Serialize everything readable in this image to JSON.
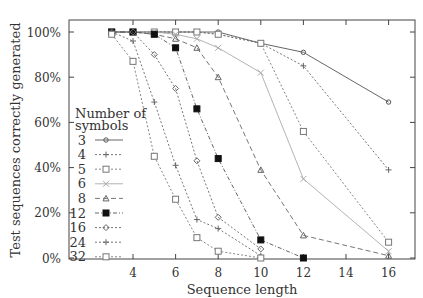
{
  "chart_data": {
    "type": "line",
    "title": "",
    "xlabel": "Sequence length",
    "ylabel": "Test sequences correctly generated",
    "xlim": [
      1,
      17
    ],
    "ylim": [
      0,
      110
    ],
    "xticks": [
      4,
      6,
      8,
      10,
      12,
      14,
      16
    ],
    "yticks": [
      0,
      20,
      40,
      60,
      80,
      100
    ],
    "ytick_labels": [
      "0%",
      "20%",
      "40%",
      "60%",
      "80%",
      "100%"
    ],
    "grid": false,
    "legend_title": [
      "Number of",
      "symbols"
    ],
    "legend_position": "inside-left",
    "series": [
      {
        "name": "3",
        "marker": "circle-dot",
        "dash": "",
        "color": "#555555",
        "x": [
          3,
          4,
          5,
          6,
          7,
          8,
          10,
          12,
          16
        ],
        "values": [
          100,
          100,
          100,
          100,
          100,
          100,
          95,
          91,
          69
        ]
      },
      {
        "name": "4",
        "marker": "plus",
        "dash": "2,2",
        "color": "#666666",
        "x": [
          3,
          4,
          5,
          6,
          7,
          8,
          10,
          12,
          16
        ],
        "values": [
          100,
          100,
          100,
          100,
          100,
          99,
          95,
          85,
          39
        ]
      },
      {
        "name": "5",
        "marker": "square",
        "dash": "2,2",
        "color": "#777777",
        "x": [
          3,
          4,
          5,
          6,
          7,
          8,
          10,
          12,
          16
        ],
        "values": [
          100,
          100,
          100,
          100,
          100,
          99,
          95,
          56,
          7
        ]
      },
      {
        "name": "6",
        "marker": "cross",
        "dash": "",
        "color": "#aaaaaa",
        "x": [
          3,
          4,
          5,
          6,
          7,
          8,
          10,
          12,
          16
        ],
        "values": [
          100,
          100,
          100,
          99,
          97,
          93,
          82,
          35,
          3
        ]
      },
      {
        "name": "8",
        "marker": "triangle",
        "dash": "5,3",
        "color": "#666666",
        "x": [
          3,
          4,
          5,
          6,
          7,
          8,
          10,
          12,
          16
        ],
        "values": [
          100,
          100,
          99,
          97,
          93,
          80,
          39,
          10,
          1
        ]
      },
      {
        "name": "12",
        "marker": "filled-square",
        "dash": "4,2,1,2",
        "color": "#555555",
        "x": [
          3,
          4,
          5,
          6,
          7,
          8,
          10,
          12
        ],
        "values": [
          100,
          100,
          99,
          93,
          66,
          44,
          8,
          0
        ]
      },
      {
        "name": "16",
        "marker": "diamond",
        "dash": "2,2",
        "color": "#666666",
        "x": [
          3,
          4,
          5,
          6,
          7,
          8,
          10
        ],
        "values": [
          100,
          100,
          90,
          75,
          43,
          18,
          4
        ]
      },
      {
        "name": "24",
        "marker": "plus",
        "dash": "2,2",
        "color": "#666666",
        "x": [
          3,
          4,
          5,
          6,
          7,
          8,
          10
        ],
        "values": [
          100,
          96,
          69,
          41,
          17,
          13,
          1
        ]
      },
      {
        "name": "32",
        "marker": "square",
        "dash": "2,2",
        "color": "#777777",
        "x": [
          3,
          4,
          5,
          6,
          7,
          8,
          10
        ],
        "values": [
          99,
          87,
          45,
          26,
          9,
          3,
          0
        ]
      }
    ]
  }
}
